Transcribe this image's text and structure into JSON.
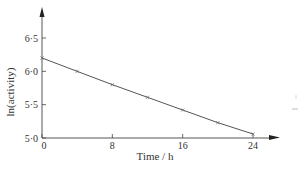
{
  "chart_data": {
    "type": "line",
    "title": "",
    "xlabel": "Time / h",
    "ylabel": "ln(activity)",
    "x": [
      0,
      4,
      8,
      12,
      16,
      20,
      24
    ],
    "series": [
      {
        "name": "ln(activity)",
        "values": [
          6.2,
          6.0,
          5.8,
          5.61,
          5.42,
          5.23,
          5.06
        ],
        "marker": "x",
        "color": "#555555"
      }
    ],
    "xticks": [
      0,
      8,
      16,
      24
    ],
    "xtick_labels": [
      "0",
      "8",
      "16",
      "24"
    ],
    "yticks": [
      5.0,
      5.5,
      6.0,
      6.5
    ],
    "ytick_labels": [
      "5·0",
      "5·5",
      "6·0",
      "6·5"
    ],
    "xlim": [
      0,
      27
    ],
    "ylim": [
      5.0,
      6.9
    ],
    "grid": false,
    "legend": "none"
  }
}
